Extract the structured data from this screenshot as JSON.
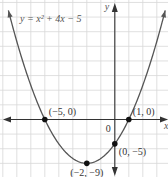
{
  "chart_data": {
    "type": "line",
    "title": "",
    "equation": "y = x² + 4x − 5",
    "xlabel": "x",
    "ylabel": "y",
    "origin_label": "0",
    "xlim": [
      -8.2,
      3.8
    ],
    "ylim": [
      -11.8,
      24.5
    ],
    "grid": true,
    "series": [
      {
        "name": "y = x^2 + 4x - 5",
        "function": {
          "a": 1,
          "b": 4,
          "c": -5
        },
        "x_range": [
          -7.6,
          3.6
        ]
      }
    ],
    "points": [
      {
        "x": -5,
        "y": 0,
        "label": "(−5, 0)"
      },
      {
        "x": 1,
        "y": 0,
        "label": "(1, 0)"
      },
      {
        "x": 0,
        "y": -5,
        "label": "(0, −5)"
      },
      {
        "x": -2,
        "y": -9,
        "label": "(−2, −9)"
      }
    ],
    "colors": {
      "curve": "#555555",
      "axes": "#333333",
      "grid": "#d8d8d8",
      "point": "#111111"
    }
  }
}
